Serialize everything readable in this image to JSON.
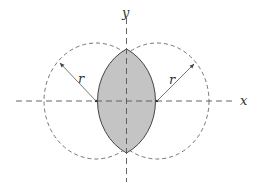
{
  "diagram": {
    "axes": {
      "x_label": "x",
      "y_label": "y"
    },
    "circles": [
      {
        "name": "left-circle",
        "radius_label": "r"
      },
      {
        "name": "right-circle",
        "radius_label": "r"
      }
    ],
    "colors": {
      "lens_fill": "#c4c4c4",
      "stroke": "#444444",
      "dashed": "#666666"
    }
  }
}
